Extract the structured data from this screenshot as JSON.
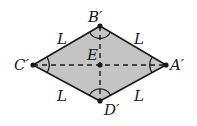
{
  "diagram": {
    "type": "rhombus",
    "fill_color": "#c4c4c4",
    "stroke_color": "#1a1a1a",
    "vertices": [
      {
        "id": "B",
        "label": "B′",
        "x": 100,
        "y": 26
      },
      {
        "id": "A",
        "label": "A′",
        "x": 166,
        "y": 65
      },
      {
        "id": "D",
        "label": "D′",
        "x": 100,
        "y": 101
      },
      {
        "id": "C",
        "label": "C′",
        "x": 33,
        "y": 65
      }
    ],
    "center": {
      "id": "E",
      "label": "E",
      "x": 100,
      "y": 65
    },
    "side_labels": [
      "L",
      "L",
      "L",
      "L"
    ],
    "diagonals": "dashed"
  }
}
